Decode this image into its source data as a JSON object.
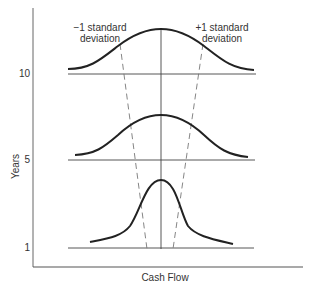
{
  "diagram": {
    "x_axis_label": "Cash Flow",
    "y_axis_label": "Years",
    "y_ticks": [
      {
        "label": "10",
        "baseline_y": 74
      },
      {
        "label": "5",
        "baseline_y": 160
      },
      {
        "label": "1",
        "baseline_y": 248
      }
    ],
    "annotations": {
      "minus_sd_line1": "−1 standard",
      "minus_sd_line2": "deviation",
      "plus_sd_line1": "+1 standard",
      "plus_sd_line2": "deviation"
    },
    "distributions": [
      {
        "year": "10",
        "shape": "wide normal curve"
      },
      {
        "year": "5",
        "shape": "medium normal curve"
      },
      {
        "year": "1",
        "shape": "narrow normal curve"
      }
    ],
    "colors": {
      "curve": "#222222",
      "axis": "#555555",
      "dashed": "#777777",
      "text": "#333333"
    }
  }
}
